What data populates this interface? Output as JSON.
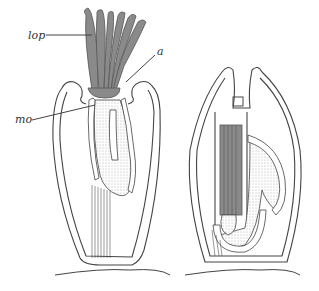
{
  "figure": {
    "type": "biological-cross-section-diagram",
    "panels": [
      {
        "id": "left",
        "description": "extended zooid with lophophore tentacles protruded"
      },
      {
        "id": "right",
        "description": "retracted zooid with lophophore withdrawn"
      }
    ],
    "labels": [
      {
        "id": "lop",
        "text": "lop"
      },
      {
        "id": "a",
        "text": "a"
      },
      {
        "id": "mo",
        "text": "mo"
      }
    ],
    "colors": {
      "ink": "#444444",
      "tentacle_fill": "#8a8a8a",
      "background": "#ffffff"
    }
  }
}
